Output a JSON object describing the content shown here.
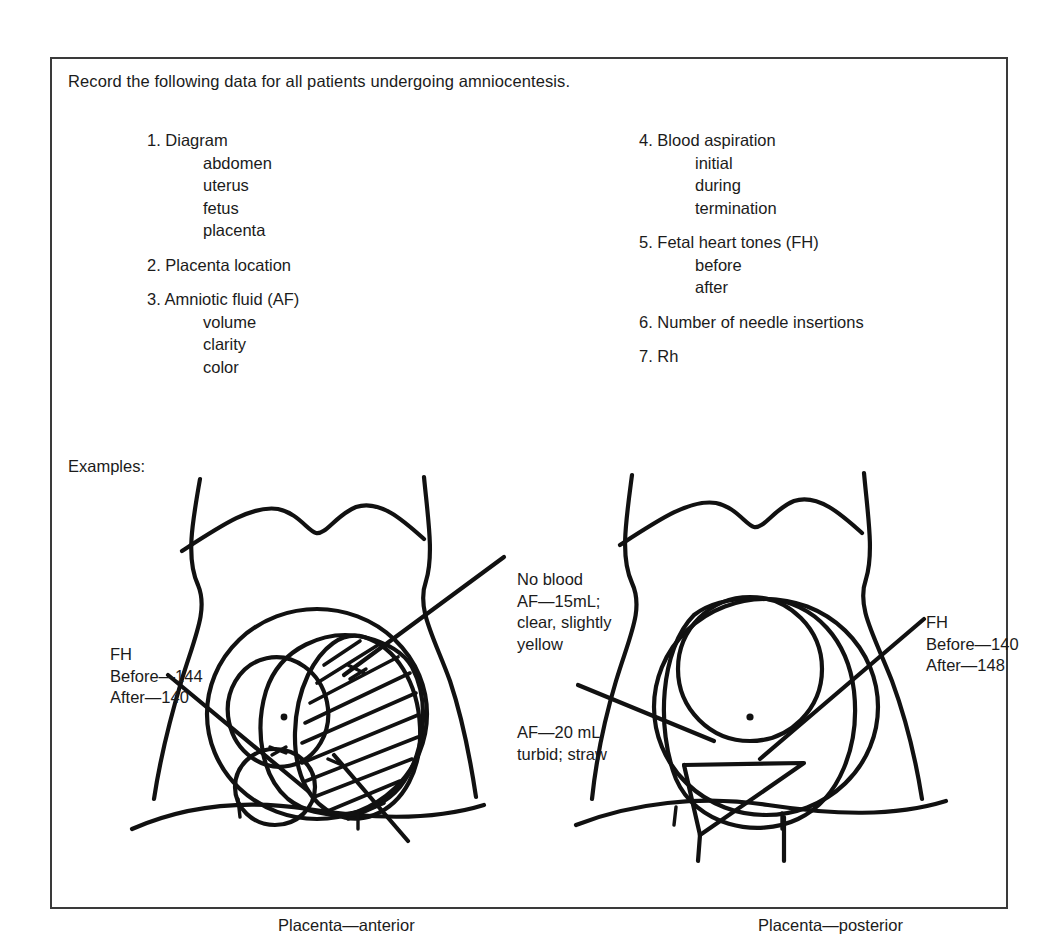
{
  "document": {
    "intro": "Record the following data for all patients undergoing amniocentesis.",
    "examples_label": "Examples:"
  },
  "checklist": {
    "left_column": [
      {
        "number": "1.",
        "label": "Diagram",
        "subitems": [
          "abdomen",
          "uterus",
          "fetus",
          "placenta"
        ]
      },
      {
        "number": "2.",
        "label": "Placenta location",
        "subitems": []
      },
      {
        "number": "3.",
        "label": "Amniotic fluid (AF)",
        "subitems": [
          "volume",
          "clarity",
          "color"
        ]
      }
    ],
    "right_column": [
      {
        "number": "4.",
        "label": "Blood aspiration",
        "subitems": [
          "initial",
          "during",
          "termination"
        ]
      },
      {
        "number": "5.",
        "label": "Fetal heart tones (FH)",
        "subitems": [
          "before",
          "after"
        ]
      },
      {
        "number": "6.",
        "label": "Number of needle insertions",
        "subitems": []
      },
      {
        "number": "7.",
        "label": "Rh",
        "subitems": []
      }
    ]
  },
  "figures": {
    "left": {
      "caption": "Placenta—anterior",
      "fh_annotation": [
        "FH",
        "Before—144",
        "After—140"
      ],
      "af_annotation": [
        "No blood",
        "AF—15mL;",
        "clear, slightly",
        "yellow"
      ],
      "drawing_name": "anterior-placenta-abdomen-diagram"
    },
    "right": {
      "caption": "Placenta—posterior",
      "fh_annotation": [
        "FH",
        "Before—140",
        "After—148"
      ],
      "af_annotation": [
        "AF—20 mL",
        "turbid; straw"
      ],
      "drawing_name": "posterior-placenta-abdomen-diagram"
    }
  },
  "colors": {
    "ink": "#111111",
    "frame": "#3a3a3a",
    "background": "#ffffff",
    "text": "#1b1b1b"
  }
}
